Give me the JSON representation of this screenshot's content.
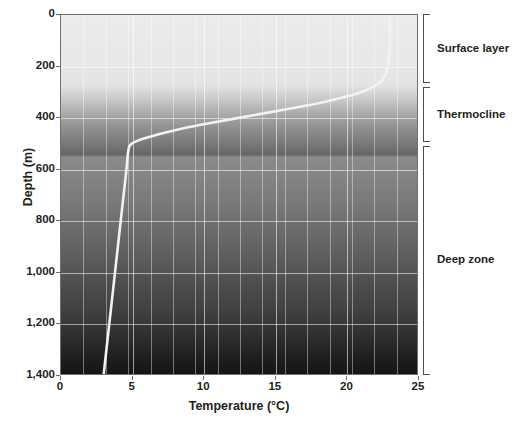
{
  "chart_data": {
    "type": "line",
    "title": "",
    "xlabel": "Temperature (°C)",
    "ylabel": "Depth (m)",
    "xlim": [
      0,
      25
    ],
    "ylim": [
      0,
      1400
    ],
    "y_inverted": true,
    "grid": true,
    "legend_position": "none",
    "x_ticks": [
      0,
      5,
      10,
      15,
      20,
      25
    ],
    "x_tick_labels": [
      "0",
      "5",
      "10",
      "15",
      "20",
      "25"
    ],
    "y_ticks": [
      0,
      200,
      400,
      600,
      800,
      1000,
      1200,
      1400
    ],
    "y_tick_labels": [
      "0",
      "200",
      "400",
      "600",
      "800",
      "1,000",
      "1,200",
      "1,400"
    ],
    "series": [
      {
        "name": "Temperature profile",
        "color": "#f2f2f2",
        "points": [
          {
            "temperature": 23.1,
            "depth": 0
          },
          {
            "temperature": 23.1,
            "depth": 60
          },
          {
            "temperature": 23.1,
            "depth": 120
          },
          {
            "temperature": 23.0,
            "depth": 180
          },
          {
            "temperature": 22.9,
            "depth": 215
          },
          {
            "temperature": 22.6,
            "depth": 250
          },
          {
            "temperature": 22.0,
            "depth": 278
          },
          {
            "temperature": 21.1,
            "depth": 300
          },
          {
            "temperature": 19.9,
            "depth": 320
          },
          {
            "temperature": 18.4,
            "depth": 340
          },
          {
            "temperature": 16.8,
            "depth": 358
          },
          {
            "temperature": 15.1,
            "depth": 375
          },
          {
            "temperature": 13.4,
            "depth": 392
          },
          {
            "temperature": 11.8,
            "depth": 408
          },
          {
            "temperature": 10.3,
            "depth": 423
          },
          {
            "temperature": 9.0,
            "depth": 437
          },
          {
            "temperature": 7.8,
            "depth": 452
          },
          {
            "temperature": 6.8,
            "depth": 466
          },
          {
            "temperature": 6.0,
            "depth": 479
          },
          {
            "temperature": 5.4,
            "depth": 490
          },
          {
            "temperature": 5.0,
            "depth": 500
          },
          {
            "temperature": 4.8,
            "depth": 512
          },
          {
            "temperature": 4.7,
            "depth": 540
          },
          {
            "temperature": 4.6,
            "depth": 600
          },
          {
            "temperature": 4.4,
            "depth": 700
          },
          {
            "temperature": 4.2,
            "depth": 800
          },
          {
            "temperature": 4.0,
            "depth": 900
          },
          {
            "temperature": 3.8,
            "depth": 1000
          },
          {
            "temperature": 3.6,
            "depth": 1100
          },
          {
            "temperature": 3.4,
            "depth": 1200
          },
          {
            "temperature": 3.2,
            "depth": 1300
          },
          {
            "temperature": 3.0,
            "depth": 1400
          }
        ]
      }
    ],
    "zones": [
      {
        "name": "Surface layer",
        "depth_from": 0,
        "depth_to": 268,
        "label": "Surface layer"
      },
      {
        "name": "Thermocline",
        "depth_from": 282,
        "depth_to": 498,
        "label": "Thermocline"
      },
      {
        "name": "Deep zone",
        "depth_from": 510,
        "depth_to": 1400,
        "label": "Deep zone"
      }
    ],
    "background": {
      "description": "vertical grayscale gradient from light at surface to near-black at depth",
      "surface_color": "#ececec",
      "deep_color": "#151515"
    }
  }
}
